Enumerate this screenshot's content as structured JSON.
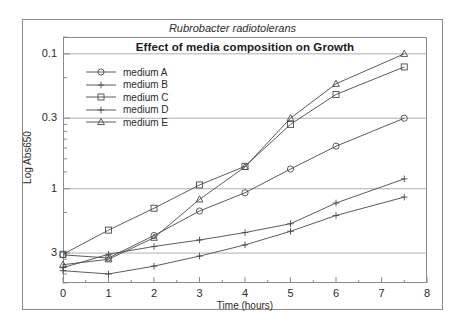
{
  "figure": {
    "supertitle": "Rubrobacter radiotolerans",
    "title": "Effect of media composition on Growth"
  },
  "axes": {
    "xlabel": "Time (hours)",
    "ylabel": "Log Abs650",
    "x_ticks": [
      "0",
      "1",
      "2",
      "3",
      "4",
      "5",
      "6",
      "7",
      "8"
    ],
    "y_ticks": [
      "3",
      "1",
      "0.3",
      "0.1"
    ]
  },
  "legend": {
    "position": "upper-left-inside",
    "entries": [
      {
        "label": "medium A",
        "marker": "circle"
      },
      {
        "label": "medium B",
        "marker": "plus"
      },
      {
        "label": "medium C",
        "marker": "square"
      },
      {
        "label": "medium D",
        "marker": "plus"
      },
      {
        "label": "medium E",
        "marker": "triangle"
      }
    ]
  },
  "chart_data": {
    "type": "line",
    "title": "Effect of media composition on Growth",
    "subtitle": "Rubrobacter radiotolerans",
    "xlabel": "Time (hours)",
    "ylabel": "Log Abs650",
    "yscale": "log",
    "xlim": [
      0,
      8
    ],
    "ylim": [
      0.06,
      4.0
    ],
    "xticks": [
      0,
      1,
      2,
      3,
      4,
      5,
      6,
      7,
      8
    ],
    "yticks": [
      0.1,
      0.3,
      1,
      3
    ],
    "grid": "major-horizontal",
    "legend_position": "upper left",
    "x": [
      0,
      1,
      2,
      3,
      4,
      5,
      6,
      7.5
    ],
    "series": [
      {
        "name": "medium A",
        "marker": "circle",
        "values": [
          0.097,
          0.092,
          0.135,
          0.205,
          0.28,
          0.42,
          0.62,
          1.0
        ]
      },
      {
        "name": "medium B",
        "marker": "plus",
        "values": [
          0.074,
          0.07,
          0.08,
          0.095,
          0.115,
          0.145,
          0.19,
          0.26
        ]
      },
      {
        "name": "medium C",
        "marker": "square",
        "values": [
          0.098,
          0.148,
          0.215,
          0.32,
          0.44,
          0.9,
          1.5,
          2.4
        ]
      },
      {
        "name": "medium D",
        "marker": "plus",
        "values": [
          0.078,
          0.098,
          0.112,
          0.125,
          0.142,
          0.165,
          0.235,
          0.355
        ]
      },
      {
        "name": "medium E",
        "marker": "triangle",
        "values": [
          0.082,
          0.09,
          0.13,
          0.25,
          0.435,
          1.0,
          1.8,
          3.0
        ]
      }
    ]
  },
  "style": {
    "line_color": "#4a4a4a",
    "grid_color": "#9a9a9a",
    "frame_color": "#8a8a8a",
    "text_color": "#2b2b2b",
    "background": "#ffffff"
  }
}
